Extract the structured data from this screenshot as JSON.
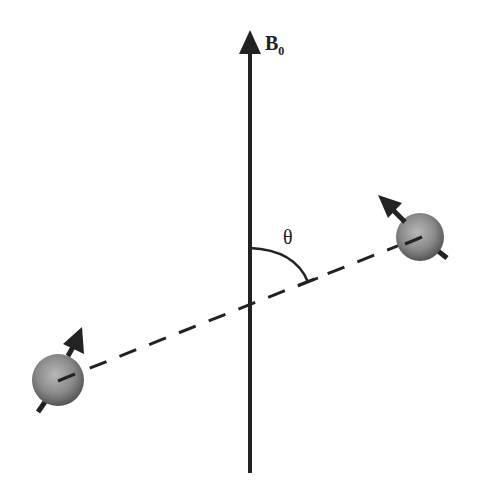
{
  "diagram": {
    "field_label": "B",
    "field_label_subscript": "0",
    "angle_label": "θ",
    "colors": {
      "line": "#222222",
      "sphere_light": "#b0b0b0",
      "sphere_dark": "#555555",
      "background": "#ffffff"
    },
    "elements": [
      "vertical field axis B0 arrow",
      "internuclear dashed vector",
      "angle arc theta between B0 and internuclear vector",
      "left spin sphere with magnetic moment arrow",
      "right spin sphere with magnetic moment arrow"
    ]
  }
}
